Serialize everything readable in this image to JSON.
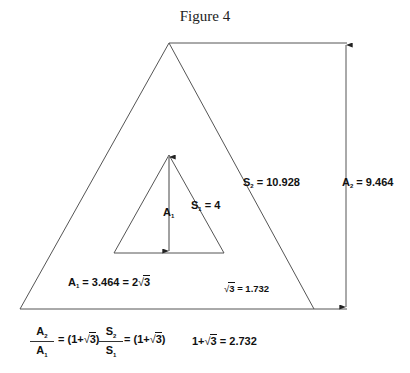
{
  "figure": {
    "title": "Figure 4",
    "outer_triangle": {
      "side_label": "S",
      "side_sub": "2",
      "side_value": "= 10.928",
      "height_label": "A",
      "height_sub": "2",
      "height_value": "= 9.464"
    },
    "inner_triangle": {
      "side_label": "S",
      "side_sub": "1",
      "side_value": "= 4",
      "height_label": "A",
      "height_sub": "1"
    },
    "equations": {
      "a1_label": "A",
      "a1_sub": "1",
      "a1_value": "= 3.464 = 2",
      "a1_radicand": "3",
      "sqrt3_radicand": "3",
      "sqrt3_value": "= 1.732",
      "ratio_a_num": "A",
      "ratio_a_num_sub": "2",
      "ratio_a_den": "A",
      "ratio_a_den_sub": "1",
      "ratio_a_value_pre": "= (1+",
      "ratio_a_radicand": "3",
      "ratio_a_value_post": ")",
      "ratio_s_num": "S",
      "ratio_s_num_sub": "2",
      "ratio_s_den": "S",
      "ratio_s_den_sub": "1",
      "ratio_s_value_pre": "= (1+",
      "ratio_s_radicand": "3",
      "ratio_s_value_post": ")",
      "sum_pre": "1+",
      "sum_radicand": "3",
      "sum_value": "= 2.732"
    },
    "radical_sign": "√",
    "colors": {
      "line": "#555555",
      "text": "#111111",
      "background": "#ffffff"
    }
  }
}
